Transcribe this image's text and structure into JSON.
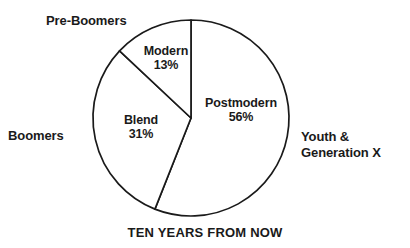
{
  "chart_data": {
    "type": "pie",
    "title": "",
    "caption": "TEN YEARS FROM NOW",
    "categories": [
      "Postmodern",
      "Blend",
      "Modern"
    ],
    "values": [
      56,
      31,
      13
    ],
    "value_labels": [
      "56%",
      "31%",
      "56%"
    ],
    "slices": [
      {
        "name": "Postmodern",
        "label": "Postmodern",
        "value": 56,
        "value_label": "56%",
        "outer_label": "Youth & Generation X",
        "start_angle_deg": 0,
        "end_angle_deg": 201.6
      },
      {
        "name": "Blend",
        "label": "Blend",
        "value": 31,
        "value_label": "31%",
        "outer_label": "Boomers",
        "start_angle_deg": 201.6,
        "end_angle_deg": 313.2
      },
      {
        "name": "Modern",
        "label": "Modern",
        "value": 13,
        "value_label": "13%",
        "outer_label": "Pre-Boomers",
        "start_angle_deg": 313.2,
        "end_angle_deg": 360
      }
    ],
    "outer_labels": [
      "Pre-Boomers",
      "Boomers",
      "Youth & Generation X"
    ],
    "legend_position": "none",
    "grid": false,
    "colors": {
      "slice_fill": "#ffffff",
      "outline": "#1a1a1a",
      "text": "#1a1a1a",
      "background": "#ffffff"
    },
    "total": 100
  },
  "labels": {
    "pre_boomers": "Pre-Boomers",
    "boomers": "Boomers",
    "youth_generation_x_line1": "Youth &",
    "youth_generation_x_line2": "Generation X",
    "modern_name": "Modern",
    "modern_pct": "13%",
    "blend_name": "Blend",
    "blend_pct": "31%",
    "postmodern_name": "Postmodern",
    "postmodern_pct": "56%"
  },
  "caption": "TEN YEARS FROM NOW"
}
